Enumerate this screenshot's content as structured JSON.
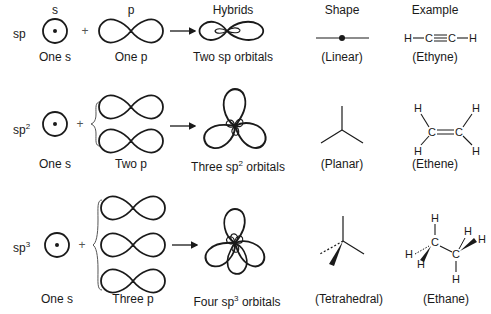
{
  "headers": {
    "s": "s",
    "p": "p",
    "hybrids": "Hybrids",
    "shape": "Shape",
    "example": "Example"
  },
  "rows": [
    {
      "hybrid": "sp",
      "hybrid_sup": "",
      "s_label": "One s",
      "p_label": "One p",
      "hybrid_label": "Two sp orbitals",
      "shape_label": "(Linear)",
      "example_label": "(Ethyne)",
      "example_formula": "H—C≡C—H"
    },
    {
      "hybrid": "sp",
      "hybrid_sup": "2",
      "s_label": "One s",
      "p_label": "Two p",
      "hybrid_label_pre": "Three sp",
      "hybrid_label_sup": "2",
      "hybrid_label_post": " orbitals",
      "shape_label": "(Planar)",
      "example_label": "(Ethene)"
    },
    {
      "hybrid": "sp",
      "hybrid_sup": "3",
      "s_label": "One s",
      "p_label": "Three p",
      "hybrid_label_pre": "Four sp",
      "hybrid_label_sup": "3",
      "hybrid_label_post": " orbitals",
      "shape_label": "(Tetrahedral)",
      "example_label": "(Ethane)"
    }
  ],
  "symbols": {
    "plus": "+",
    "H": "H",
    "C": "C"
  }
}
